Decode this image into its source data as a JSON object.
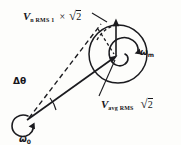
{
  "figure": {
    "kind": "vector-phasor-diagram",
    "background_color": "#fdfdfb",
    "ink_color": "#16161a",
    "width": 181,
    "height": 145
  },
  "labels": {
    "noise_vector": {
      "symbol": "V",
      "subscript": "n RMS 1",
      "operator": "×",
      "factor_sign": "√",
      "factor_value": "2",
      "full_text": "V n RMS 1 × √2"
    },
    "average_vector": {
      "symbol": "V",
      "subscript": "avg RMS",
      "factor_sign": "√",
      "factor_value": "2",
      "full_text": "V avg RMS √2"
    },
    "modulation_rate": {
      "symbol": "ω",
      "subscript": "m",
      "full_text": "ωm"
    },
    "carrier_rate": {
      "symbol": "ω",
      "subscript": "0",
      "full_text": "ω0"
    },
    "phase_deviation": {
      "symbol": "Δθ",
      "full_text": "Δθ"
    }
  },
  "geometry": {
    "big_circle": {
      "cx": 118,
      "cy": 54,
      "r": 29
    },
    "origin": {
      "x": 26,
      "y": 120
    },
    "tip": {
      "x": 118,
      "y": 57
    },
    "vertical_arrow_top": {
      "x": 116,
      "y": 20
    }
  },
  "icons": {
    "rotation_arrow_m": "circular-arrow-icon",
    "rotation_arrow_0": "circular-arrow-icon",
    "angle_arc": "arc-icon"
  }
}
